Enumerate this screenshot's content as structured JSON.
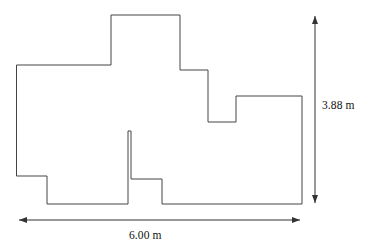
{
  "figure": {
    "type": "floor-plan-outline-diagram",
    "stroke_color": "#444444",
    "fill_color": "#ffffff",
    "background_color": "#ffffff",
    "stroke_width": 1,
    "outline_path": "M 17 65 L 111 65 L 111 15 L 180 15 L 180 70 L 208 70 L 208 122 L 236 122 L 236 96 L 302 96 L 302 204 L 162 204 L 162 179 L 131 179 L 131 131 L 128 131 L 128 204 L 47 204 L 47 176 L 17 176 Z",
    "vertices": [
      [
        17,
        65
      ],
      [
        111,
        65
      ],
      [
        111,
        15
      ],
      [
        180,
        15
      ],
      [
        180,
        70
      ],
      [
        208,
        70
      ],
      [
        208,
        122
      ],
      [
        236,
        122
      ],
      [
        236,
        96
      ],
      [
        302,
        96
      ],
      [
        302,
        204
      ],
      [
        162,
        204
      ],
      [
        162,
        179
      ],
      [
        131,
        179
      ],
      [
        131,
        131
      ],
      [
        128,
        131
      ],
      [
        128,
        204
      ],
      [
        47,
        204
      ],
      [
        47,
        176
      ],
      [
        17,
        176
      ]
    ]
  },
  "dimensions": {
    "width": {
      "label": "6.00 m",
      "value": 6.0,
      "unit": "m",
      "orientation": "horizontal",
      "arrow": {
        "x1": 19,
        "y1": 220,
        "x2": 300,
        "y2": 220
      },
      "arrowheads": "both"
    },
    "height": {
      "label": "3.88 m",
      "value": 3.88,
      "unit": "m",
      "orientation": "vertical",
      "arrow": {
        "x1": 315,
        "y1": 15,
        "x2": 315,
        "y2": 204
      },
      "arrowheads": "both"
    }
  }
}
